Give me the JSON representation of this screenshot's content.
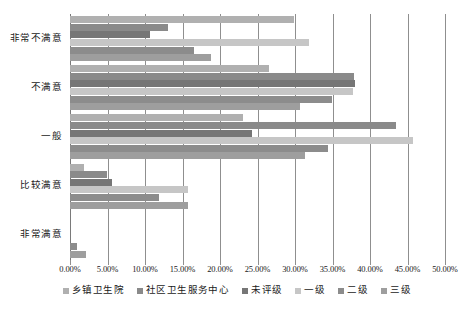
{
  "chart_data": {
    "type": "bar",
    "orientation": "horizontal",
    "title": "",
    "xlabel": "",
    "ylabel": "",
    "xlim": [
      0,
      50
    ],
    "xtick_step": 5,
    "grid": true,
    "legend_position": "bottom",
    "categories": [
      "非常不满意",
      "不满意",
      "一般",
      "比较满意",
      "非常满意"
    ],
    "xticks": [
      "0.00%",
      "5.00%",
      "10.00%",
      "15.00%",
      "20.00%",
      "25.00%",
      "30.00%",
      "35.00%",
      "40.00%",
      "45.00%",
      "50.00%"
    ],
    "xtick_values": [
      0,
      5,
      10,
      15,
      20,
      25,
      30,
      35,
      40,
      45,
      50
    ],
    "series": [
      {
        "name": "乡镇卫生院",
        "color": "#b0b0b0",
        "values": [
          29.8,
          26.5,
          23.1,
          1.8,
          0.0
        ]
      },
      {
        "name": "社区卫生服务中心",
        "color": "#8a8a8a",
        "values": [
          13.1,
          37.9,
          43.5,
          4.9,
          0.0
        ]
      },
      {
        "name": "未评级",
        "color": "#767676",
        "values": [
          10.6,
          38.0,
          24.2,
          5.6,
          0.0
        ]
      },
      {
        "name": "一级",
        "color": "#c6c6c6",
        "values": [
          31.9,
          37.7,
          45.7,
          15.7,
          0.0
        ]
      },
      {
        "name": "二级",
        "color": "#8c8c8c",
        "values": [
          16.5,
          34.9,
          34.4,
          11.8,
          0.9
        ]
      },
      {
        "name": "三级",
        "color": "#9e9e9e",
        "values": [
          18.8,
          30.7,
          31.3,
          15.7,
          2.1
        ]
      }
    ]
  },
  "caption": ""
}
